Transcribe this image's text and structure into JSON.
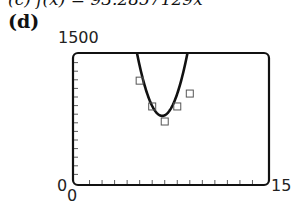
{
  "header": {
    "cut_text": "(c) f(x) = 93.2857129x",
    "part_label": "(d)"
  },
  "chart_data": {
    "type": "scatter",
    "title": "",
    "xlabel": "",
    "ylabel": "",
    "xlim": [
      0,
      15
    ],
    "ylim": [
      0,
      1500
    ],
    "xtick_step": 1,
    "ytick_step": 100,
    "tick_labels": {
      "xmin": "0",
      "xmax": "15",
      "ymin": "0",
      "ymax": "1500"
    },
    "series": [
      {
        "name": "data",
        "marker": "square",
        "x": [
          5,
          6,
          7,
          8,
          9
        ],
        "y": [
          1190,
          890,
          715,
          890,
          1040
        ]
      },
      {
        "name": "quadratic model",
        "style": "line",
        "vertex": [
          6.8,
          780
        ],
        "a": 180
      }
    ],
    "grid": false,
    "legend": null
  }
}
